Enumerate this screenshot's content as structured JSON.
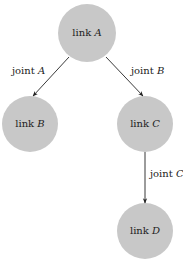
{
  "diagram": {
    "type": "tree",
    "nodes": [
      {
        "id": "A",
        "prefix": "link",
        "var": "A",
        "cx": 87,
        "cy": 33,
        "r": 29
      },
      {
        "id": "B",
        "prefix": "link",
        "var": "B",
        "cx": 30,
        "cy": 124,
        "r": 28
      },
      {
        "id": "C",
        "prefix": "link",
        "var": "C",
        "cx": 145,
        "cy": 124,
        "r": 28
      },
      {
        "id": "D",
        "prefix": "link",
        "var": "D",
        "cx": 145,
        "cy": 231,
        "r": 28
      }
    ],
    "edges": [
      {
        "from": "A",
        "to": "B",
        "prefix": "joint",
        "var": "A"
      },
      {
        "from": "A",
        "to": "C",
        "prefix": "joint",
        "var": "B"
      },
      {
        "from": "C",
        "to": "D",
        "prefix": "joint",
        "var": "C"
      }
    ],
    "colors": {
      "node_fill": "#c8c8c8",
      "edge": "#222222",
      "text": "#222222"
    }
  }
}
